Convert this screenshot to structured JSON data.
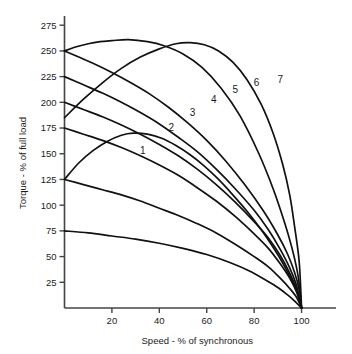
{
  "chart_data": {
    "type": "line",
    "title": "",
    "xlabel": "Speed - % of synchronous",
    "ylabel": "Torque - % of full load",
    "xlim": [
      0,
      112
    ],
    "ylim": [
      0,
      282
    ],
    "grid": false,
    "legend_position": "inline-curve-labels",
    "xticks": [
      20,
      40,
      60,
      80,
      100
    ],
    "xtick_labels": [
      "20",
      "40",
      "60",
      "80",
      "100"
    ],
    "yticks": [
      25,
      50,
      75,
      100,
      125,
      150,
      175,
      200,
      225,
      250,
      275
    ],
    "ytick_labels": [
      "25",
      "50",
      "75",
      "100",
      "125",
      "150",
      "175",
      "200",
      "225",
      "250",
      "275"
    ],
    "annotations": [
      {
        "text": "1",
        "x": 33,
        "y": 150
      },
      {
        "text": "2",
        "x": 45,
        "y": 172
      },
      {
        "text": "3",
        "x": 54,
        "y": 187
      },
      {
        "text": "4",
        "x": 63,
        "y": 199
      },
      {
        "text": "5",
        "x": 72,
        "y": 209
      },
      {
        "text": "6",
        "x": 81,
        "y": 216
      },
      {
        "text": "7",
        "x": 91,
        "y": 219
      }
    ],
    "series": [
      {
        "name": "curve-a",
        "label": "",
        "start_torque": 250,
        "peak": {
          "x": 27,
          "y": 261
        },
        "points": [
          [
            0,
            250
          ],
          [
            5,
            254
          ],
          [
            10,
            257
          ],
          [
            15,
            259
          ],
          [
            20,
            260
          ],
          [
            27,
            261
          ],
          [
            35,
            259
          ],
          [
            42,
            255
          ],
          [
            50,
            247
          ],
          [
            58,
            234
          ],
          [
            66,
            214
          ],
          [
            74,
            187
          ],
          [
            82,
            150
          ],
          [
            88,
            116
          ],
          [
            93,
            82
          ],
          [
            96,
            58
          ],
          [
            98,
            38
          ],
          [
            99,
            24
          ],
          [
            100,
            0
          ]
        ]
      },
      {
        "name": "curve-b",
        "label": "",
        "start_torque": 250,
        "peak": {
          "x": 0,
          "y": 250
        },
        "points": [
          [
            0,
            250
          ],
          [
            6,
            244
          ],
          [
            12,
            238
          ],
          [
            20,
            229
          ],
          [
            28,
            219
          ],
          [
            36,
            208
          ],
          [
            44,
            195
          ],
          [
            52,
            180
          ],
          [
            60,
            163
          ],
          [
            68,
            143
          ],
          [
            76,
            120
          ],
          [
            84,
            94
          ],
          [
            90,
            71
          ],
          [
            94,
            53
          ],
          [
            97,
            35
          ],
          [
            99,
            18
          ],
          [
            100,
            0
          ]
        ]
      },
      {
        "name": "curve-c",
        "label": "",
        "start_torque": 225,
        "peak": {
          "x": 0,
          "y": 225
        },
        "points": [
          [
            0,
            225
          ],
          [
            8,
            217
          ],
          [
            16,
            209
          ],
          [
            24,
            200
          ],
          [
            32,
            190
          ],
          [
            40,
            179
          ],
          [
            48,
            166
          ],
          [
            56,
            152
          ],
          [
            64,
            135
          ],
          [
            72,
            116
          ],
          [
            80,
            95
          ],
          [
            86,
            76
          ],
          [
            91,
            57
          ],
          [
            95,
            39
          ],
          [
            98,
            21
          ],
          [
            100,
            0
          ]
        ]
      },
      {
        "name": "curve-d",
        "label": "",
        "start_torque": 200,
        "peak": {
          "x": 0,
          "y": 200
        },
        "points": [
          [
            0,
            200
          ],
          [
            8,
            193
          ],
          [
            16,
            186
          ],
          [
            24,
            178
          ],
          [
            32,
            169
          ],
          [
            40,
            159
          ],
          [
            48,
            148
          ],
          [
            56,
            135
          ],
          [
            64,
            120
          ],
          [
            72,
            103
          ],
          [
            80,
            84
          ],
          [
            86,
            68
          ],
          [
            91,
            51
          ],
          [
            95,
            34
          ],
          [
            98,
            18
          ],
          [
            100,
            0
          ]
        ]
      },
      {
        "name": "curve-e",
        "label": "",
        "start_torque": 185,
        "peak": {
          "x": 53,
          "y": 258
        },
        "points": [
          [
            0,
            185
          ],
          [
            8,
            203
          ],
          [
            16,
            219
          ],
          [
            24,
            233
          ],
          [
            32,
            244
          ],
          [
            40,
            252
          ],
          [
            47,
            257
          ],
          [
            53,
            258
          ],
          [
            59,
            256
          ],
          [
            65,
            250
          ],
          [
            71,
            239
          ],
          [
            77,
            222
          ],
          [
            83,
            198
          ],
          [
            88,
            170
          ],
          [
            92,
            140
          ],
          [
            95,
            110
          ],
          [
            97,
            80
          ],
          [
            99,
            45
          ],
          [
            100,
            0
          ]
        ]
      },
      {
        "name": "curve-f",
        "label": "",
        "start_torque": 175,
        "peak": {
          "x": 0,
          "y": 175
        },
        "points": [
          [
            0,
            175
          ],
          [
            8,
            169
          ],
          [
            16,
            163
          ],
          [
            24,
            156
          ],
          [
            32,
            148
          ],
          [
            40,
            139
          ],
          [
            48,
            129
          ],
          [
            56,
            117
          ],
          [
            64,
            104
          ],
          [
            72,
            89
          ],
          [
            80,
            72
          ],
          [
            86,
            58
          ],
          [
            91,
            43
          ],
          [
            95,
            29
          ],
          [
            98,
            15
          ],
          [
            100,
            0
          ]
        ]
      },
      {
        "name": "curve-g",
        "label": "",
        "start_torque": 125,
        "peak": {
          "x": 27,
          "y": 170
        },
        "points": [
          [
            0,
            125
          ],
          [
            6,
            141
          ],
          [
            12,
            153
          ],
          [
            18,
            162
          ],
          [
            24,
            168
          ],
          [
            29,
            170
          ],
          [
            35,
            169
          ],
          [
            41,
            165
          ],
          [
            47,
            158
          ],
          [
            53,
            149
          ],
          [
            59,
            138
          ],
          [
            65,
            125
          ],
          [
            71,
            110
          ],
          [
            77,
            94
          ],
          [
            83,
            76
          ],
          [
            88,
            59
          ],
          [
            92,
            44
          ],
          [
            95,
            31
          ],
          [
            98,
            16
          ],
          [
            100,
            0
          ]
        ]
      },
      {
        "name": "curve-h",
        "label": "",
        "start_torque": 125,
        "peak": {
          "x": 0,
          "y": 125
        },
        "points": [
          [
            0,
            125
          ],
          [
            8,
            120
          ],
          [
            16,
            115
          ],
          [
            24,
            110
          ],
          [
            32,
            104
          ],
          [
            40,
            97
          ],
          [
            48,
            90
          ],
          [
            56,
            82
          ],
          [
            64,
            73
          ],
          [
            72,
            62
          ],
          [
            80,
            50
          ],
          [
            86,
            40
          ],
          [
            91,
            29
          ],
          [
            95,
            19
          ],
          [
            98,
            10
          ],
          [
            100,
            0
          ]
        ]
      },
      {
        "name": "curve-i",
        "label": "",
        "start_torque": 75,
        "peak": {
          "x": 0,
          "y": 75
        },
        "points": [
          [
            0,
            75
          ],
          [
            10,
            73
          ],
          [
            20,
            70
          ],
          [
            30,
            67
          ],
          [
            40,
            63
          ],
          [
            50,
            58
          ],
          [
            60,
            52
          ],
          [
            70,
            44
          ],
          [
            78,
            36
          ],
          [
            85,
            27
          ],
          [
            90,
            20
          ],
          [
            94,
            13
          ],
          [
            97,
            7
          ],
          [
            100,
            0
          ]
        ]
      }
    ]
  },
  "axes": {
    "y_title": "Torque - % of full load",
    "x_title": "Speed - % of synchronous"
  }
}
